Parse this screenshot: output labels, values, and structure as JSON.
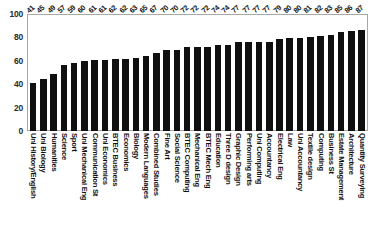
{
  "chart_data": {
    "type": "bar",
    "title": "",
    "xlabel": "",
    "ylabel": "",
    "ylim": [
      0,
      100
    ],
    "ytick_labels": [
      "100",
      "80",
      "60",
      "40",
      "20",
      "0"
    ],
    "yticks": [
      100,
      80,
      60,
      40,
      20,
      0
    ],
    "grid": false,
    "legend": null,
    "bar_color": "#101010",
    "show_value_labels": true,
    "categories": [
      "Uni History/English",
      "Uni Biology",
      "Humanities",
      "Science",
      "Sport",
      "Uni Mechanical Eng",
      "Communication St",
      "Uni Economics",
      "BTEC Business",
      "Economics",
      "Biology",
      "Modern Languages",
      "Combined Studies",
      "Fine Art",
      "Social Science",
      "BTEC Computing",
      "Mechanical Eng",
      "BTEC Mech Eng",
      "Education",
      "Three D design",
      "Graphic Design",
      "Performing arts",
      "Uni Computing",
      "Accountancy",
      "Electrical Eng",
      "Law",
      "Uni Accountancy",
      "Textile design",
      "Computing",
      "Business St",
      "Estate Management",
      "Architecture",
      "Quantity Surveying"
    ],
    "values": [
      41,
      45,
      49,
      57,
      59,
      60,
      61,
      61,
      62,
      62,
      63,
      65,
      67,
      70,
      70,
      72,
      72,
      72,
      74,
      74,
      77,
      77,
      77,
      77,
      79,
      80,
      80,
      81,
      82,
      83,
      85,
      86,
      87
    ]
  }
}
